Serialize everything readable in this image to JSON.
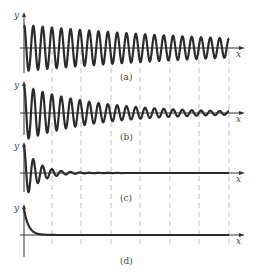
{
  "figure": {
    "panels": [
      {
        "id": "a",
        "caption": "(a)",
        "y_label": "y",
        "x_label": "x",
        "damping": 0.08,
        "cycles": 22,
        "description": "lightly damped oscillation"
      },
      {
        "id": "b",
        "caption": "(b)",
        "y_label": "y",
        "x_label": "x",
        "damping": 0.25,
        "cycles": 22,
        "description": "moderately damped oscillation"
      },
      {
        "id": "c",
        "caption": "(c)",
        "y_label": "y",
        "x_label": "x",
        "damping": 1.2,
        "cycles": 22,
        "description": "heavily damped oscillation"
      },
      {
        "id": "d",
        "caption": "(d)",
        "y_label": "y",
        "x_label": "x",
        "damping": 0,
        "cycles": 0,
        "description": "overdamped decay"
      }
    ],
    "dashed_gridlines_x": [
      52,
      81,
      111,
      140,
      170,
      199,
      229
    ],
    "colors": {
      "curve": "#2b2b2b",
      "axis": "#333333",
      "grid": "#b0b0b0",
      "text": "#444444"
    }
  },
  "chart_data": {
    "type": "line",
    "title": "",
    "series": [
      {
        "name": "(a)",
        "form": "y = e^(-0.08t) cos(ωt)"
      },
      {
        "name": "(b)",
        "form": "y = e^(-0.25t) cos(ωt)"
      },
      {
        "name": "(c)",
        "form": "y = e^(-1.2t) cos(ωt)"
      },
      {
        "name": "(d)",
        "form": "y = e^(-kt), no oscillation"
      }
    ],
    "xlabel": "x",
    "ylabel": "y",
    "grid": "vertical dashed lines"
  }
}
